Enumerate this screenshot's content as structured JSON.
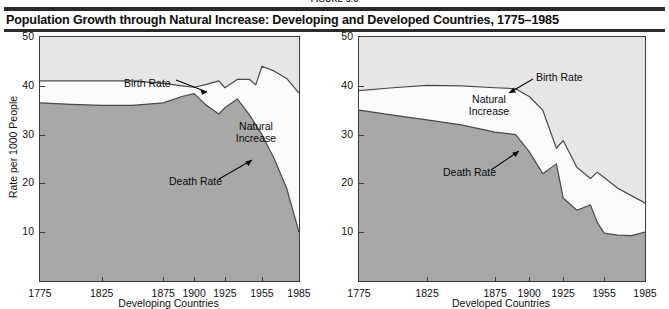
{
  "figure": {
    "label": "FIGURE 3.6"
  },
  "title": "Population Growth through Natural Increase: Developing and Developed Countries, 1775–1985",
  "colors": {
    "rule": "#2a2a2a",
    "above_birth_fill": "#e6e6e6",
    "natural_increase_fill": "#fbfbfb",
    "death_fill": "#a8a8a8",
    "curve_stroke": "#4a4a4a",
    "axis": "#3b3b3b",
    "text": "#111111"
  },
  "axes": {
    "y_label": "Rate per 1000 People",
    "y_ticks": [
      10,
      20,
      30,
      40,
      50
    ],
    "y_min": 0,
    "y_max": 50,
    "x_ticks": [
      1775,
      1825,
      1875,
      1900,
      1925,
      1955,
      1985
    ],
    "x_tick_labels": [
      "1775",
      "1825",
      "1875",
      "1900",
      "1925",
      "1955",
      "1985"
    ]
  },
  "annotations": {
    "birth_rate": "Birth Rate",
    "death_rate": "Death Rate",
    "natural_increase_line1": "Natural",
    "natural_increase_line2": "Increase"
  },
  "chart_data": [
    {
      "type": "area",
      "title": "Developing Countries",
      "xlabel": "Developing Countries",
      "ylabel": "Rate per 1000 People",
      "ylim": [
        0,
        50
      ],
      "xlim": [
        1775,
        1985
      ],
      "grid": false,
      "legend": "in-plot annotations",
      "x": [
        1775,
        1800,
        1825,
        1850,
        1875,
        1890,
        1900,
        1910,
        1920,
        1925,
        1935,
        1945,
        1950,
        1955,
        1965,
        1975,
        1985
      ],
      "series": [
        {
          "name": "Birth Rate",
          "values": [
            41.0,
            41.0,
            41.0,
            41.0,
            40.5,
            40.0,
            39.7,
            40.3,
            41.0,
            39.6,
            41.3,
            41.3,
            40.2,
            44.0,
            43.0,
            41.5,
            38.5
          ]
        },
        {
          "name": "Death Rate",
          "values": [
            36.5,
            36.2,
            36.0,
            36.0,
            36.5,
            37.8,
            38.4,
            36.0,
            34.2,
            35.5,
            37.3,
            34.0,
            32.0,
            30.0,
            25.0,
            19.0,
            10.0
          ]
        }
      ],
      "derived_series": {
        "name": "Natural Increase",
        "note": "region between Birth Rate and Death Rate"
      }
    },
    {
      "type": "area",
      "title": "Developed Countries",
      "xlabel": "Developed Countries",
      "ylabel": "Rate per 1000 People",
      "ylim": [
        0,
        50
      ],
      "xlim": [
        1775,
        1985
      ],
      "grid": false,
      "legend": "in-plot annotations",
      "x": [
        1775,
        1800,
        1825,
        1850,
        1875,
        1890,
        1900,
        1910,
        1920,
        1925,
        1935,
        1945,
        1950,
        1955,
        1965,
        1975,
        1985
      ],
      "series": [
        {
          "name": "Birth Rate",
          "values": [
            39.0,
            39.6,
            40.1,
            40.0,
            39.6,
            39.4,
            37.8,
            35.0,
            27.2,
            28.8,
            23.3,
            21.0,
            22.3,
            21.2,
            19.0,
            17.5,
            16.0
          ]
        },
        {
          "name": "Death Rate",
          "values": [
            35.0,
            34.0,
            33.0,
            32.0,
            30.5,
            30.0,
            26.5,
            22.0,
            24.0,
            17.0,
            14.5,
            15.6,
            12.0,
            9.8,
            9.4,
            9.3,
            10.0
          ]
        }
      ],
      "derived_series": {
        "name": "Natural Increase",
        "note": "region between Birth Rate and Death Rate"
      }
    }
  ]
}
